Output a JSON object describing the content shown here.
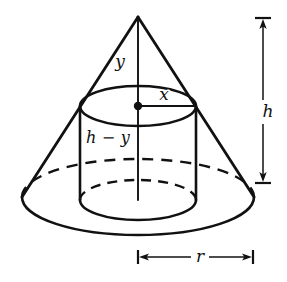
{
  "figure": {
    "stroke_color": "#111111",
    "background_color": "#ffffff",
    "labels": {
      "cone_upper_height": "y",
      "cylinder_radius": "x",
      "cylinder_height": "h − y",
      "cone_height": "h",
      "cone_radius": "r"
    },
    "geometry": {
      "cone": {
        "apex_x": 138,
        "apex_y": 17,
        "base_center_x": 138,
        "base_center_y": 197,
        "base_rx": 116,
        "base_ry": 38
      },
      "cylinder": {
        "center_x": 138,
        "top_center_y": 106,
        "bottom_center_y": 200,
        "rx": 58,
        "ry": 20
      },
      "axis": {
        "x": 138,
        "top_y": 17,
        "bottom_y": 200
      },
      "height_dimension": {
        "x": 263,
        "top_y": 18,
        "bottom_y": 183,
        "cap_half_width": 8
      },
      "radius_dimension": {
        "y": 257,
        "left_x": 138,
        "right_x": 253,
        "cap_half_height": 7
      },
      "radius_line": {
        "from_x": 138,
        "to_x": 196,
        "y": 106
      },
      "center_dot": {
        "x": 138,
        "y": 106,
        "r": 4
      }
    },
    "label_positions": {
      "cone_upper_height": {
        "x": 120,
        "y": 62
      },
      "cylinder_radius": {
        "x": 164,
        "y": 95
      },
      "cylinder_height": {
        "x": 108,
        "y": 138
      },
      "cone_height": {
        "x": 268,
        "y": 112
      },
      "cone_radius": {
        "x": 200,
        "y": 257
      }
    }
  }
}
